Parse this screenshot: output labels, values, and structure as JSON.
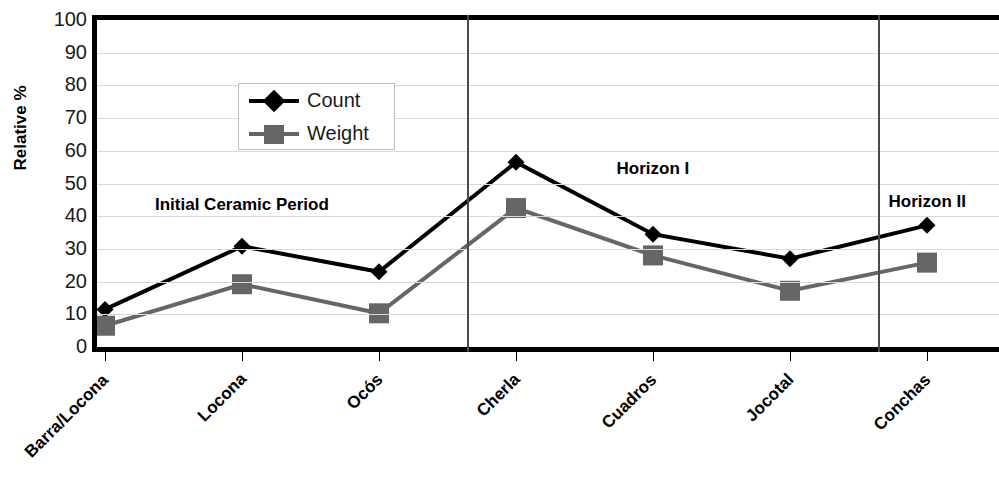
{
  "chart_data": {
    "type": "line",
    "title": "",
    "xlabel": "",
    "ylabel": "Relative %",
    "ylim": [
      0,
      100
    ],
    "ytick_values": [
      100,
      90,
      80,
      70,
      60,
      50,
      40,
      30,
      20,
      10,
      0
    ],
    "grid": true,
    "legend_position": "upper-left-inside",
    "categories": [
      "Barra/Locona",
      "Locona",
      "Ocós",
      "Cherla",
      "Cuadros",
      "Jocotal",
      "Conchas"
    ],
    "series": [
      {
        "name": "Count",
        "color": "#000000",
        "marker": "diamond",
        "values": [
          11.5,
          30.8,
          23.0,
          56.5,
          34.5,
          27.0,
          37.2
        ]
      },
      {
        "name": "Weight",
        "color": "#666666",
        "marker": "square",
        "values": [
          6.5,
          19.2,
          10.3,
          42.5,
          28.0,
          17.2,
          25.8
        ]
      }
    ],
    "annotations": [
      {
        "text": "Initial Ceramic Period",
        "x_category": "Locona",
        "value": 43
      },
      {
        "text": "Horizon I",
        "x_category": "Cuadros",
        "value": 54
      },
      {
        "text": "Horizon II",
        "x_category": "Conchas",
        "value": 44
      }
    ],
    "dividers": [
      {
        "between": [
          "Ocós",
          "Cherla"
        ],
        "label_left": "Initial Ceramic Period",
        "label_right": "Horizon I"
      },
      {
        "between": [
          "Jocotal",
          "Conchas"
        ],
        "label_left": "Horizon I",
        "label_right": "Horizon II"
      }
    ]
  },
  "legend": {
    "items": [
      {
        "label": "Count"
      },
      {
        "label": "Weight"
      }
    ]
  },
  "axis": {
    "y_title": "Relative %"
  }
}
